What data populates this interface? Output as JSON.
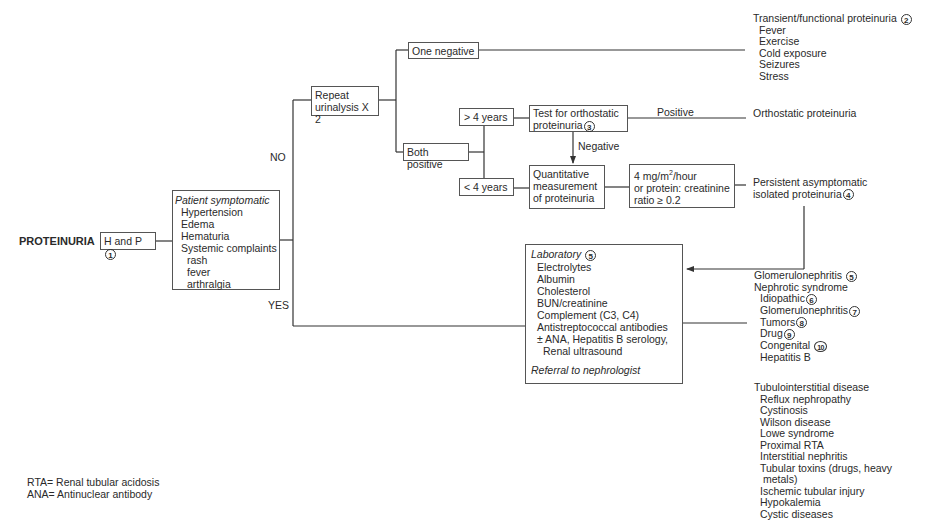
{
  "root": {
    "label": "PROTEINURIA"
  },
  "history": {
    "label": "H and P",
    "note": "1"
  },
  "symptomatic_box": {
    "title": "Patient symptomatic",
    "items": [
      "Hypertension",
      "Edema",
      "Hematuria",
      "Systemic complaints"
    ],
    "subitems": [
      "rash",
      "fever",
      "arthralgia"
    ]
  },
  "branches": {
    "no": "NO",
    "yes": "YES"
  },
  "repeat_box": {
    "line1": "Repeat",
    "line2": "urinalysis X 2"
  },
  "one_negative": {
    "label": "One negative"
  },
  "both_positive": {
    "label": "Both positive"
  },
  "age_over": {
    "label": "> 4 years"
  },
  "age_under": {
    "label": "< 4 years"
  },
  "orthostatic_test": {
    "line1": "Test for orthostatic",
    "line2": "proteinuria",
    "note": "3"
  },
  "positive_label": "Positive",
  "negative_label": "Negative",
  "quantitative_box": {
    "line1": "Quantitative",
    "line2": "measurement",
    "line3": "of proteinuria"
  },
  "threshold_box": {
    "line1_pre": "4 mg/m",
    "line1_sup": "2",
    "line1_post": "/hour",
    "line2": "or protein: creatinine",
    "line3": "ratio ≥ 0.2"
  },
  "transient": {
    "title": "Transient/functional proteinuria",
    "note": "2",
    "items": [
      "Fever",
      "Exercise",
      "Cold exposure",
      "Seizures",
      "Stress"
    ]
  },
  "orthostatic_result": "Orthostatic proteinuria",
  "persistent": {
    "line1": "Persistent asymptomatic",
    "line2": "isolated proteinuria",
    "note": "4"
  },
  "laboratory": {
    "title": "Laboratory",
    "note": "5",
    "items": [
      "Electrolytes",
      "Albumin",
      "Cholesterol",
      "BUN/creatinine",
      "Complement (C3, C4)",
      "Antistreptococcal antibodies",
      "± ANA, Hepatitis B serology,",
      "Renal ultrasound"
    ],
    "referral": "Referral to nephrologist"
  },
  "diagnoses": {
    "glomerulonephritis": {
      "label": "Glomerulonephritis",
      "note": "5"
    },
    "nephrotic": {
      "label": "Nephrotic syndrome",
      "items": [
        {
          "label": "Idiopathic",
          "note": "6"
        },
        {
          "label": "Glomerulonephritis",
          "note": "7"
        },
        {
          "label": "Tumors",
          "note": "8"
        },
        {
          "label": "Drug",
          "note": "9"
        },
        {
          "label": "Congenital",
          "note": "10"
        },
        {
          "label": "Hepatitis B",
          "note": ""
        }
      ]
    },
    "tubulointerstitial": {
      "label": "Tubulointerstitial disease",
      "items": [
        "Reflux nephropathy",
        "Cystinosis",
        "Wilson disease",
        "Lowe syndrome",
        "Proximal RTA",
        "Interstitial nephritis",
        "Tubular toxins (drugs, heavy",
        "metals)",
        "Ischemic tubular injury",
        "Hypokalemia",
        "Cystic diseases"
      ]
    }
  },
  "legend": {
    "rta": "RTA= Renal tubular acidosis",
    "ana": "ANA= Antinuclear antibody"
  },
  "colors": {
    "line": "#333333",
    "text": "#2a2a2a",
    "box_border": "#555555"
  }
}
